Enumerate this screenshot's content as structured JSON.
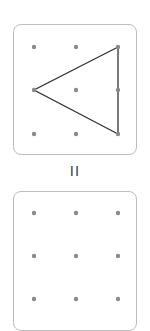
{
  "boards": [
    {
      "name": "geoboard-with-triangle",
      "grid": {
        "rows": 3,
        "cols": 3,
        "x": [
          34,
          76,
          118
        ],
        "y": [
          47,
          90,
          134
        ]
      },
      "shape": {
        "type": "triangle",
        "points": [
          [
            118,
            47
          ],
          [
            34,
            90
          ],
          [
            118,
            134
          ]
        ]
      }
    },
    {
      "name": "empty-geoboard",
      "grid": {
        "rows": 3,
        "cols": 3,
        "x": [
          34,
          76,
          118
        ],
        "y": [
          213,
          256,
          299
        ]
      }
    }
  ],
  "separator": {
    "symbol": "II"
  },
  "colors": {
    "border": "#bdbdbd",
    "dot": "#8a8a8a",
    "line": "#333333"
  }
}
